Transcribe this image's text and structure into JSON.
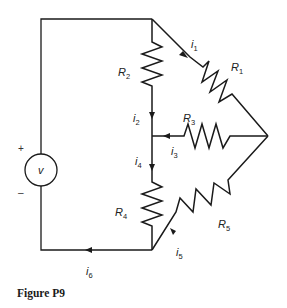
{
  "caption": "Figure P9",
  "source": {
    "label": "v",
    "plus": "+",
    "minus": "–"
  },
  "resistors": {
    "r1": {
      "name": "R",
      "sub": "1"
    },
    "r2": {
      "name": "R",
      "sub": "2"
    },
    "r3": {
      "name": "R",
      "sub": "3"
    },
    "r4": {
      "name": "R",
      "sub": "4"
    },
    "r5": {
      "name": "R",
      "sub": "5"
    }
  },
  "currents": {
    "i1": {
      "name": "i",
      "sub": "1"
    },
    "i2": {
      "name": "i",
      "sub": "2"
    },
    "i3": {
      "name": "i",
      "sub": "3"
    },
    "i4": {
      "name": "i",
      "sub": "4"
    },
    "i5": {
      "name": "i",
      "sub": "5"
    },
    "i6": {
      "name": "i",
      "sub": "6"
    }
  }
}
